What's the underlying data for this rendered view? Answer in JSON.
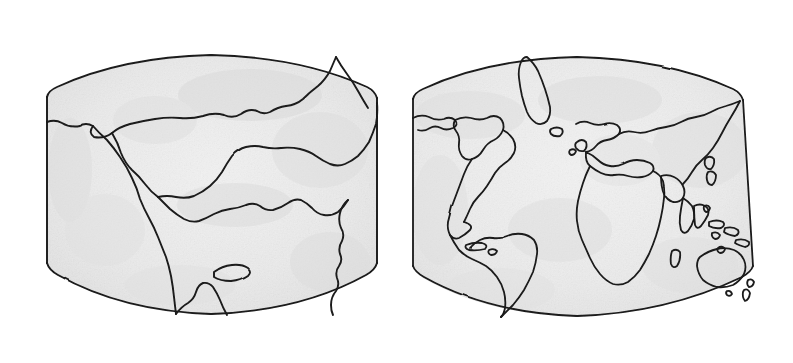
{
  "illustration": {
    "kind": "hand-drawn-ink-sketch",
    "subject": "continental-drift-comparison",
    "background_color": "#ffffff",
    "ink_color": "#1a1a1a",
    "landmass_fill": "#eeeeee",
    "shading_color": "#dedede"
  },
  "panels": [
    {
      "id": "pangaea",
      "caption": "200 million years ago",
      "caption_style": "handwritten-italic",
      "map_shape": "barrel-projection",
      "landmasses": [
        "pangaea-supercontinent",
        "laurasia-northwest-block",
        "tethys-inland-sea-margin",
        "gondwana-southern-block",
        "small-island"
      ]
    },
    {
      "id": "today",
      "caption": "Today",
      "caption_style": "handwritten-italic",
      "map_shape": "barrel-projection",
      "landmasses": [
        "north-america",
        "greenland",
        "south-america",
        "africa",
        "europe",
        "asia",
        "india",
        "arabia",
        "madagascar",
        "indonesia",
        "japan",
        "australia",
        "new-zealand",
        "caribbean-islands",
        "british-isles",
        "iceland",
        "philippines",
        "new-guinea"
      ]
    }
  ]
}
